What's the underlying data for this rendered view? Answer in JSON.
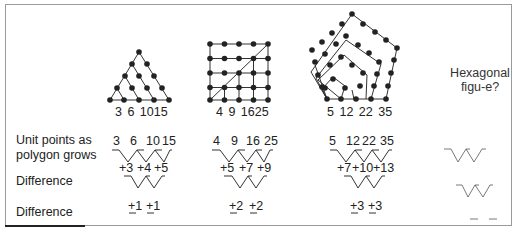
{
  "figures": [
    {
      "name": "triangular",
      "base_labels": "3  6  1015",
      "sequence": [
        3,
        6,
        10,
        15
      ]
    },
    {
      "name": "square",
      "base_labels": "4  9  1625",
      "sequence": [
        4,
        9,
        16,
        25
      ]
    },
    {
      "name": "pentagonal",
      "base_labels": "5 12  22 35",
      "sequence": [
        5,
        12,
        22,
        35
      ]
    },
    {
      "name": "hexagonal",
      "question": [
        "Hexagonal",
        "figu-e?"
      ]
    }
  ],
  "rows": {
    "unit_points_label": [
      "Unit points as",
      "polygon grows"
    ],
    "difference1_label": "Difference",
    "difference2_label": "Difference"
  },
  "table": {
    "triangular": {
      "points": [
        "3",
        "6",
        "10",
        "15"
      ],
      "diff1": [
        "+3",
        "+4",
        "+5"
      ],
      "diff2": [
        "+1",
        "+1"
      ]
    },
    "square": {
      "points": [
        "4",
        "9",
        "16",
        "25"
      ],
      "diff1": [
        "+5",
        "+7",
        "+9"
      ],
      "diff2": [
        "+2",
        "+2"
      ]
    },
    "pentagonal": {
      "points": [
        "5",
        "12",
        "22",
        "35"
      ],
      "diff1": [
        "+7",
        "+10",
        "+13"
      ],
      "diff2": [
        "+3",
        "+3"
      ]
    }
  },
  "colors": {
    "ink": "#222222",
    "frame": "#9a9a9a",
    "faint": "#555555"
  }
}
